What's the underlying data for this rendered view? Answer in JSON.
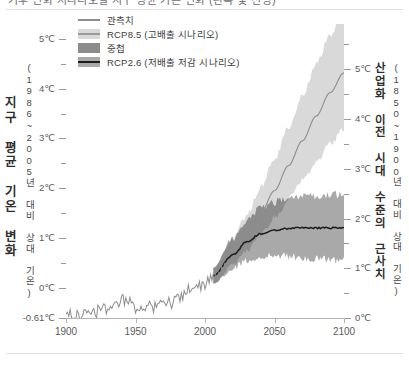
{
  "caption": {
    "text": "기후 변화 시나리오별 지구 평균 기온 변화 (관측 및 전망)"
  },
  "legend": {
    "items": [
      {
        "label": "관측치",
        "swatch": "line-grey",
        "color": "#8e8e8e"
      },
      {
        "label": "RCP8.5 (고배출 시나리오)",
        "swatch": "band-light",
        "color": "#d9d9d9"
      },
      {
        "label": "중첩",
        "swatch": "band-overlap",
        "color": "#8c8c8c"
      },
      {
        "label": "RCP2.6 (저배출 저감 시나리오)",
        "swatch": "band-mid",
        "color": "#a9a9a9"
      }
    ]
  },
  "axes": {
    "left_title_main": "지구 평균 기온 변화",
    "left_title_sub": "(1986~2005년 대비 상대 기온)",
    "right_title_main": "산업화 이전 시대 수준의 근사치",
    "right_title_sub": "(1850~1900년 대비 상대 기온)",
    "left_ticks": [
      "5℃",
      "4℃",
      "3℃",
      "2℃",
      "1℃",
      "0℃",
      "-0.61℃"
    ],
    "right_ticks": [
      "5℃",
      "4℃",
      "3℃",
      "2℃",
      "1℃",
      "0℃"
    ],
    "x_ticks": [
      "1900",
      "1950",
      "2000",
      "2050",
      "2100"
    ]
  },
  "chart_data": {
    "type": "line",
    "title": "기후 변화 시나리오별 지구 평균 기온 변화 (관측 및 전망)",
    "xlabel": "",
    "ylabel": "지구 평균 기온 변화 (1986~2005년 대비 상대 기온)",
    "y2label": "산업화 이전 시대 수준의 근사치 (1850~1900년 대비 상대 기온)",
    "xlim": [
      1900,
      2100
    ],
    "ylim": [
      -0.61,
      5.3
    ],
    "y2lim": [
      0.0,
      5.91
    ],
    "y_offset_to_y2": 0.61,
    "grid": false,
    "legend_position": "top-left",
    "xticks": [
      1900,
      1950,
      2000,
      2050,
      2100
    ],
    "yticks": [
      0,
      1,
      2,
      3,
      4,
      5
    ],
    "yticks_minor": [
      0.5,
      1.5,
      2.5,
      3.5,
      4.5
    ],
    "y2ticks": [
      0,
      1,
      2,
      3,
      4,
      5
    ],
    "baseline_value": -0.61,
    "projection_start_year": 2006,
    "series": [
      {
        "name": "관측치",
        "kind": "line",
        "color": "#8e8e8e",
        "noise_amplitude": 0.13,
        "x": [
          1900,
          1905,
          1910,
          1915,
          1920,
          1925,
          1930,
          1935,
          1940,
          1945,
          1950,
          1955,
          1960,
          1965,
          1970,
          1975,
          1980,
          1985,
          1990,
          1995,
          2000,
          2005,
          2010,
          2015
        ],
        "y": [
          -0.51,
          -0.56,
          -0.6,
          -0.46,
          -0.49,
          -0.47,
          -0.41,
          -0.42,
          -0.26,
          -0.3,
          -0.39,
          -0.4,
          -0.34,
          -0.4,
          -0.3,
          -0.31,
          -0.17,
          -0.18,
          0.0,
          0.04,
          0.09,
          0.19,
          0.25,
          0.4
        ]
      },
      {
        "name": "RCP8.5 (고배출 시나리오)",
        "kind": "line-with-band",
        "line_color": "#8e8e8e",
        "band_color": "#d9d9d9",
        "x": [
          2006,
          2020,
          2030,
          2040,
          2050,
          2060,
          2070,
          2080,
          2090,
          2100
        ],
        "y": [
          0.24,
          0.7,
          1.08,
          1.5,
          1.95,
          2.45,
          2.95,
          3.45,
          3.92,
          4.32
        ],
        "band_low": [
          0.08,
          0.45,
          0.74,
          1.06,
          1.4,
          1.78,
          2.15,
          2.52,
          2.88,
          3.2
        ],
        "band_high": [
          0.4,
          0.98,
          1.46,
          2.0,
          2.58,
          3.22,
          3.86,
          4.5,
          5.08,
          5.6
        ]
      },
      {
        "name": "RCP2.6 (저배출 저감 시나리오)",
        "kind": "line-with-band",
        "line_color": "#1c1c1c",
        "band_color": "#a9a9a9",
        "x": [
          2006,
          2020,
          2030,
          2040,
          2050,
          2060,
          2070,
          2080,
          2090,
          2100
        ],
        "y": [
          0.24,
          0.66,
          0.92,
          1.08,
          1.16,
          1.19,
          1.2,
          1.2,
          1.2,
          1.21
        ],
        "band_low": [
          0.08,
          0.38,
          0.54,
          0.62,
          0.64,
          0.63,
          0.6,
          0.58,
          0.56,
          0.55
        ],
        "band_high": [
          0.4,
          0.98,
          1.34,
          1.58,
          1.72,
          1.78,
          1.82,
          1.84,
          1.86,
          1.88
        ]
      }
    ],
    "overlap_color": "#8c8c8c"
  }
}
